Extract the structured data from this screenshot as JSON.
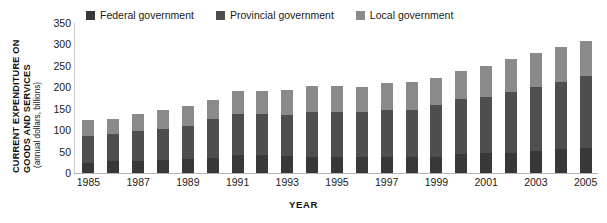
{
  "chart_data": {
    "type": "bar",
    "subtype": "stacked-vertical",
    "title": "",
    "xlabel": "YEAR",
    "ylabel": "CURRENT EXPENDITURE ON GOODS AND SERVICES",
    "ylabel_lines": [
      "CURRENT EXPENDITURE ON",
      "GOODS AND SERVICES"
    ],
    "ylabel_sub": "(annual dollars, billions)",
    "ylim": [
      0,
      350
    ],
    "yticks": [
      350,
      300,
      250,
      200,
      150,
      100,
      50,
      0
    ],
    "grid": false,
    "legend_position": "top",
    "categories": [
      "1985",
      "1986",
      "1987",
      "1988",
      "1989",
      "1990",
      "1991",
      "1992",
      "1993",
      "1994",
      "1995",
      "1996",
      "1997",
      "1998",
      "1999",
      "2000",
      "2001",
      "2002",
      "2003",
      "2004",
      "2005"
    ],
    "xtick_labels": [
      "1985",
      "1987",
      "1989",
      "1991",
      "1993",
      "1995",
      "1997",
      "1999",
      "2001",
      "2003",
      "2005"
    ],
    "xtick_categories": [
      "1985",
      "1987",
      "1989",
      "1991",
      "1993",
      "1995",
      "1997",
      "1999",
      "2001",
      "2003",
      "2005"
    ],
    "series": [
      {
        "name": "Federal government",
        "color": "#383838",
        "values": [
          24,
          27,
          27,
          31,
          32,
          35,
          41,
          41,
          39,
          38,
          38,
          38,
          38,
          38,
          38,
          45,
          46,
          46,
          52,
          55,
          59
        ]
      },
      {
        "name": "Provincial government",
        "color": "#4e4e4e",
        "values": [
          63,
          63,
          70,
          72,
          78,
          90,
          96,
          97,
          96,
          104,
          104,
          105,
          110,
          110,
          121,
          127,
          132,
          142,
          148,
          158,
          168
        ]
      },
      {
        "name": "Local government",
        "color": "#8a8a8a",
        "values": [
          36,
          37,
          40,
          43,
          47,
          46,
          55,
          54,
          59,
          60,
          61,
          58,
          63,
          64,
          62,
          66,
          72,
          77,
          80,
          81,
          80
        ]
      }
    ],
    "totals": [
      123,
      127,
      137,
      146,
      157,
      171,
      192,
      192,
      194,
      202,
      203,
      201,
      211,
      212,
      221,
      238,
      250,
      265,
      280,
      294,
      307
    ]
  },
  "legend": {
    "items": [
      {
        "label": "Federal government",
        "color": "#383838"
      },
      {
        "label": "Provincial government",
        "color": "#4e4e4e"
      },
      {
        "label": "Local government",
        "color": "#8a8a8a"
      }
    ]
  },
  "colors": {
    "federal": "#383838",
    "provincial": "#4e4e4e",
    "local": "#8a8a8a",
    "axis": "#b4b4b4",
    "text": "#1a1a1a",
    "background": "#ffffff"
  }
}
